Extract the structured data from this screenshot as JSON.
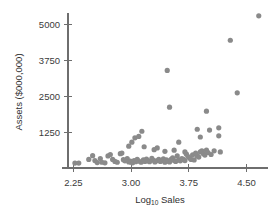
{
  "chart_data": {
    "type": "scatter",
    "title": "",
    "xlabel": "Log10 Sales",
    "xlabel_base": "Log",
    "xlabel_subscript": "10",
    "xlabel_rest": " Sales",
    "ylabel": "Assets ($000,000)",
    "xticks": [
      "2.25",
      "3.00",
      "3.75",
      "4.50"
    ],
    "xtick_values": [
      2.25,
      3.0,
      3.75,
      4.5
    ],
    "yticks": [
      "1250",
      "2500",
      "3750",
      "5000"
    ],
    "ytick_values": [
      1250,
      2500,
      3750,
      5000
    ],
    "xlim": [
      2.18,
      4.78
    ],
    "ylim": [
      0,
      5400
    ],
    "grid": false,
    "legend": false,
    "marker_color": "#8a8a8a",
    "marker_radius": 2.6,
    "axis_color": "#6e6e6e",
    "background": "#ffffff",
    "points": [
      [
        2.27,
        170
      ],
      [
        2.32,
        170
      ],
      [
        2.45,
        300
      ],
      [
        2.5,
        430
      ],
      [
        2.53,
        260
      ],
      [
        2.56,
        190
      ],
      [
        2.6,
        330
      ],
      [
        2.62,
        200
      ],
      [
        2.66,
        180
      ],
      [
        2.7,
        420
      ],
      [
        2.73,
        470
      ],
      [
        2.76,
        300
      ],
      [
        2.79,
        230
      ],
      [
        2.82,
        200
      ],
      [
        2.86,
        500
      ],
      [
        2.88,
        520
      ],
      [
        2.9,
        290
      ],
      [
        2.92,
        250
      ],
      [
        2.95,
        330
      ],
      [
        2.97,
        210
      ],
      [
        2.99,
        240
      ],
      [
        3.0,
        200
      ],
      [
        3.02,
        180
      ],
      [
        3.04,
        260
      ],
      [
        3.06,
        220
      ],
      [
        3.08,
        300
      ],
      [
        3.1,
        240
      ],
      [
        3.13,
        200
      ],
      [
        3.16,
        280
      ],
      [
        3.18,
        230
      ],
      [
        3.2,
        310
      ],
      [
        3.22,
        250
      ],
      [
        3.24,
        220
      ],
      [
        3.27,
        340
      ],
      [
        3.29,
        270
      ],
      [
        3.31,
        210
      ],
      [
        3.33,
        250
      ],
      [
        3.36,
        300
      ],
      [
        3.38,
        230
      ],
      [
        3.4,
        260
      ],
      [
        3.42,
        320
      ],
      [
        3.44,
        200
      ],
      [
        3.46,
        280
      ],
      [
        3.48,
        240
      ],
      [
        3.5,
        210
      ],
      [
        3.52,
        300
      ],
      [
        3.54,
        350
      ],
      [
        3.56,
        260
      ],
      [
        3.58,
        230
      ],
      [
        3.6,
        420
      ],
      [
        3.62,
        280
      ],
      [
        3.64,
        250
      ],
      [
        3.66,
        330
      ],
      [
        3.68,
        300
      ],
      [
        3.7,
        260
      ],
      [
        3.72,
        480
      ],
      [
        3.74,
        400
      ],
      [
        3.76,
        350
      ],
      [
        3.78,
        300
      ],
      [
        3.8,
        460
      ],
      [
        3.82,
        280
      ],
      [
        3.84,
        520
      ],
      [
        3.86,
        420
      ],
      [
        3.88,
        380
      ],
      [
        3.9,
        560
      ],
      [
        3.92,
        600
      ],
      [
        3.94,
        500
      ],
      [
        3.96,
        450
      ],
      [
        3.98,
        620
      ],
      [
        4.0,
        540
      ],
      [
        4.04,
        470
      ],
      [
        4.08,
        600
      ],
      [
        2.97,
        760
      ],
      [
        3.01,
        900
      ],
      [
        3.05,
        1050
      ],
      [
        3.1,
        1100
      ],
      [
        3.14,
        1280
      ],
      [
        3.17,
        740
      ],
      [
        3.3,
        640
      ],
      [
        3.34,
        700
      ],
      [
        3.44,
        580
      ],
      [
        3.56,
        620
      ],
      [
        3.62,
        900
      ],
      [
        3.7,
        560
      ],
      [
        3.86,
        1350
      ],
      [
        3.9,
        1080
      ],
      [
        4.02,
        1320
      ],
      [
        4.14,
        1400
      ],
      [
        4.14,
        1120
      ],
      [
        4.16,
        560
      ],
      [
        3.5,
        2120
      ],
      [
        3.47,
        3400
      ],
      [
        3.98,
        1980
      ],
      [
        4.38,
        2620
      ],
      [
        4.29,
        4450
      ],
      [
        4.66,
        5300
      ]
    ]
  }
}
